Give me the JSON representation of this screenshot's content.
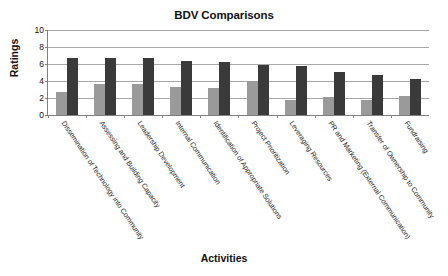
{
  "chart_data": {
    "type": "bar",
    "title": "BDV Comparisons",
    "xlabel": "Activities",
    "ylabel": "Ratings",
    "ylim": [
      0,
      10
    ],
    "yticks": [
      0,
      2,
      4,
      6,
      8,
      10
    ],
    "grid": true,
    "legend": "none",
    "categories": [
      "Dissemination of Technology into Community",
      "Assessing and Building Capacity",
      "Leadership Development",
      "Internal Communication",
      "Identification of Appropriate Solutions",
      "Project Prioritization",
      "Leveraging Resources",
      "PR and Marketing (External Communication)",
      "Transfer of Ownership to Community",
      "Fundraising"
    ],
    "series": [
      {
        "name": "Series 1",
        "color": "#9a9a9a",
        "values": [
          2.7,
          3.65,
          3.65,
          3.3,
          3.2,
          4.0,
          1.8,
          2.1,
          1.8,
          2.25
        ]
      },
      {
        "name": "Series 2",
        "color": "#3a3a3a",
        "values": [
          6.7,
          6.7,
          6.7,
          6.3,
          6.2,
          5.9,
          5.75,
          5.1,
          4.75,
          4.2
        ]
      }
    ]
  }
}
